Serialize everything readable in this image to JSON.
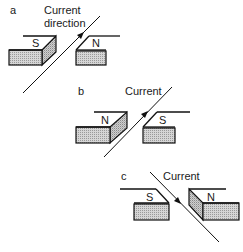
{
  "figure": {
    "panels": [
      {
        "id": "a",
        "label": "a",
        "current_label_line1": "Current",
        "current_label_line2": "direction",
        "left_pole": "S",
        "right_pole": "N",
        "wire_direction": "up-right"
      },
      {
        "id": "b",
        "label": "b",
        "current_label_line1": "Current",
        "left_pole": "N",
        "right_pole": "S",
        "wire_direction": "up-right"
      },
      {
        "id": "c",
        "label": "c",
        "current_label_line1": "Current",
        "left_pole": "S",
        "right_pole": "N",
        "wire_direction": "down-right"
      }
    ]
  }
}
